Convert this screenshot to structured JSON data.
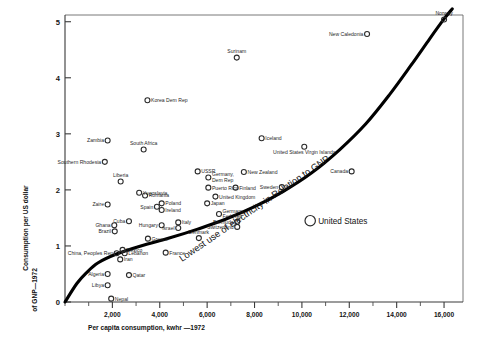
{
  "chart_data": {
    "type": "scatter",
    "title": "",
    "xlabel": "Per capita consumption, kwhr —1972",
    "ylabel_line1": "Consumption per US dollar",
    "ylabel_line2": "of GNP—1972",
    "xlim": [
      0,
      16800
    ],
    "ylim": [
      0,
      5.12
    ],
    "xticks": [
      0,
      1000,
      2000,
      3000,
      4000,
      5000,
      6000,
      7000,
      8000,
      9000,
      10000,
      11000,
      12000,
      13000,
      14000,
      15000,
      16000
    ],
    "xtick_labels": [
      "",
      "",
      "2,000",
      "",
      "4,000",
      "",
      "6,000",
      "",
      "8,000",
      "",
      "10,000",
      "",
      "12,000",
      "",
      "14,000",
      "",
      "16,000"
    ],
    "yticks": [
      0,
      1,
      2,
      3,
      4,
      5
    ],
    "ytick_labels": [
      "0",
      "1",
      "2",
      "3",
      "4",
      "5"
    ],
    "grid": false,
    "legend": "none",
    "annotation": {
      "text": "Lowest use of electricity in Relation to GNP",
      "type": "curve-label"
    },
    "curve": {
      "name": "Lowest use of electricity in Relation to GNP",
      "points": [
        [
          0,
          0.0
        ],
        [
          500,
          0.33
        ],
        [
          900,
          0.52
        ],
        [
          1400,
          0.7
        ],
        [
          2200,
          0.86
        ],
        [
          3200,
          1.0
        ],
        [
          4400,
          1.14
        ],
        [
          5600,
          1.3
        ],
        [
          6800,
          1.48
        ],
        [
          8000,
          1.7
        ],
        [
          9200,
          1.97
        ],
        [
          10400,
          2.3
        ],
        [
          11600,
          2.72
        ],
        [
          12700,
          3.18
        ],
        [
          13700,
          3.7
        ],
        [
          14600,
          4.22
        ],
        [
          15400,
          4.7
        ],
        [
          16000,
          5.05
        ],
        [
          16350,
          5.23
        ]
      ]
    },
    "points": [
      {
        "name": "Surinam",
        "x": 7250,
        "y": 4.36,
        "label_pos": "above"
      },
      {
        "name": "New Caledonia",
        "x": 12750,
        "y": 4.78,
        "label_pos": "left"
      },
      {
        "name": "Norway",
        "x": 16000,
        "y": 5.04,
        "label_pos": "above"
      },
      {
        "name": "Korea Dem Rep",
        "x": 3480,
        "y": 3.6,
        "label_pos": "right"
      },
      {
        "name": "Iceland",
        "x": 8300,
        "y": 2.92,
        "label_pos": "right"
      },
      {
        "name": "United States Virgin Islands",
        "x": 10100,
        "y": 2.77,
        "label_pos": "below"
      },
      {
        "name": "Zambia",
        "x": 1800,
        "y": 2.88,
        "label_pos": "left"
      },
      {
        "name": "South Africa",
        "x": 3320,
        "y": 2.72,
        "label_pos": "above"
      },
      {
        "name": "Southern Rhodesia",
        "x": 1680,
        "y": 2.5,
        "label_pos": "left"
      },
      {
        "name": "USSR",
        "x": 5600,
        "y": 2.33,
        "label_pos": "right"
      },
      {
        "name": "New Zealand",
        "x": 7550,
        "y": 2.32,
        "label_pos": "right"
      },
      {
        "name": "Canada",
        "x": 12100,
        "y": 2.33,
        "label_pos": "left"
      },
      {
        "name": "Liberia",
        "x": 2350,
        "y": 2.15,
        "label_pos": "above"
      },
      {
        "name": "Germany, Dem Rep",
        "x": 6050,
        "y": 2.22,
        "label_pos": "right"
      },
      {
        "name": "Puerto Rico",
        "x": 6050,
        "y": 2.04,
        "label_pos": "right"
      },
      {
        "name": "Finland",
        "x": 7200,
        "y": 2.04,
        "label_pos": "right"
      },
      {
        "name": "Sweden",
        "x": 9150,
        "y": 2.05,
        "label_pos": "left"
      },
      {
        "name": "Yugoslavia",
        "x": 3130,
        "y": 1.95,
        "label_pos": "right"
      },
      {
        "name": "Romania",
        "x": 3380,
        "y": 1.9,
        "label_pos": "right"
      },
      {
        "name": "United Kingdom",
        "x": 6350,
        "y": 1.88,
        "label_pos": "right"
      },
      {
        "name": "Zaire",
        "x": 1800,
        "y": 1.74,
        "label_pos": "left"
      },
      {
        "name": "Poland",
        "x": 4080,
        "y": 1.76,
        "label_pos": "right"
      },
      {
        "name": "Japan",
        "x": 6000,
        "y": 1.76,
        "label_pos": "right"
      },
      {
        "name": "Spain",
        "x": 3880,
        "y": 1.7,
        "label_pos": "left"
      },
      {
        "name": "Ireland",
        "x": 4080,
        "y": 1.64,
        "label_pos": "right"
      },
      {
        "name": "Germany, Fed Rep",
        "x": 6500,
        "y": 1.57,
        "label_pos": "right"
      },
      {
        "name": "Cuba",
        "x": 2700,
        "y": 1.44,
        "label_pos": "left"
      },
      {
        "name": "Italy",
        "x": 4780,
        "y": 1.42,
        "label_pos": "right"
      },
      {
        "name": "Bermuda",
        "x": 7270,
        "y": 1.43,
        "label_pos": "left"
      },
      {
        "name": "Ghana",
        "x": 2080,
        "y": 1.37,
        "label_pos": "left"
      },
      {
        "name": "Hungary",
        "x": 4080,
        "y": 1.37,
        "label_pos": "left"
      },
      {
        "name": "Israel",
        "x": 4780,
        "y": 1.32,
        "label_pos": "left"
      },
      {
        "name": "Switzerland",
        "x": 7270,
        "y": 1.34,
        "label_pos": "left"
      },
      {
        "name": "Brazil",
        "x": 2100,
        "y": 1.26,
        "label_pos": "left"
      },
      {
        "name": "Greece",
        "x": 3500,
        "y": 1.13,
        "label_pos": "right"
      },
      {
        "name": "Denmark",
        "x": 5650,
        "y": 1.14,
        "label_pos": "above"
      },
      {
        "name": "Mexico",
        "x": 2430,
        "y": 0.93,
        "label_pos": "right"
      },
      {
        "name": "China, Peoples Rep",
        "x": 2180,
        "y": 0.87,
        "label_pos": "left"
      },
      {
        "name": "Lebanon",
        "x": 2520,
        "y": 0.87,
        "label_pos": "right"
      },
      {
        "name": "Iran",
        "x": 2330,
        "y": 0.76,
        "label_pos": "right"
      },
      {
        "name": "France",
        "x": 4250,
        "y": 0.88,
        "label_pos": "right"
      },
      {
        "name": "Algeria",
        "x": 1800,
        "y": 0.5,
        "label_pos": "left"
      },
      {
        "name": "Qatar",
        "x": 2700,
        "y": 0.48,
        "label_pos": "right"
      },
      {
        "name": "Libya",
        "x": 1800,
        "y": 0.3,
        "label_pos": "left"
      },
      {
        "name": "Nepal",
        "x": 1950,
        "y": 0.06,
        "label_pos": "right"
      },
      {
        "name": "United States",
        "x": 10350,
        "y": 1.45,
        "label_pos": "right",
        "big": true
      }
    ]
  }
}
